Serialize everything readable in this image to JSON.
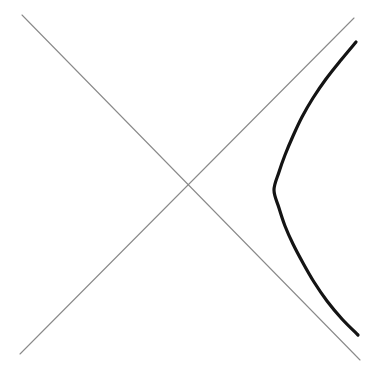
{
  "figure": {
    "type": "math-plot",
    "background_color": "#ffffff",
    "width": 376,
    "height": 374
  },
  "chart_data": {
    "type": "line",
    "subtitle": "",
    "xlabel": "",
    "ylabel": "",
    "xlim": [
      0,
      376
    ],
    "ylim": [
      374,
      0
    ],
    "grid": false,
    "legend": "none",
    "axes_visible": false,
    "tick_labels_x": [],
    "tick_labels_y": [],
    "annotations": [],
    "geometry": {
      "center": {
        "x": 191,
        "y": 190
      },
      "vertex": {
        "x": 273,
        "y": 190
      },
      "semi_axis_a": 82,
      "semi_axis_b": 82,
      "asymptote_slopes": [
        1,
        -1
      ],
      "opens": "right",
      "branches_drawn": 1
    },
    "series": [
      {
        "name": "asymptote-descending",
        "role": "asymptote",
        "kind": "straight-line",
        "color": "#8a8a8a",
        "stroke_width": 1.1,
        "slope": 1,
        "points": [
          {
            "x": 22,
            "y": 15
          },
          {
            "x": 360,
            "y": 360
          }
        ]
      },
      {
        "name": "asymptote-ascending",
        "role": "asymptote",
        "kind": "straight-line",
        "color": "#8a8a8a",
        "stroke_width": 1.1,
        "slope": -1,
        "points": [
          {
            "x": 20,
            "y": 354
          },
          {
            "x": 354,
            "y": 18
          }
        ]
      },
      {
        "name": "hyperbola-right-branch",
        "role": "curve",
        "kind": "hyperbola",
        "color": "#141414",
        "stroke_width": 3.2,
        "points": [
          {
            "x": 356,
            "y": 42
          },
          {
            "x": 341,
            "y": 60
          },
          {
            "x": 326,
            "y": 79
          },
          {
            "x": 313,
            "y": 98
          },
          {
            "x": 302,
            "y": 117
          },
          {
            "x": 293,
            "y": 136
          },
          {
            "x": 285,
            "y": 155
          },
          {
            "x": 279,
            "y": 172
          },
          {
            "x": 274,
            "y": 190
          },
          {
            "x": 279,
            "y": 208
          },
          {
            "x": 285,
            "y": 226
          },
          {
            "x": 293,
            "y": 244
          },
          {
            "x": 303,
            "y": 263
          },
          {
            "x": 314,
            "y": 282
          },
          {
            "x": 327,
            "y": 301
          },
          {
            "x": 342,
            "y": 319
          },
          {
            "x": 358,
            "y": 335
          }
        ]
      }
    ]
  }
}
